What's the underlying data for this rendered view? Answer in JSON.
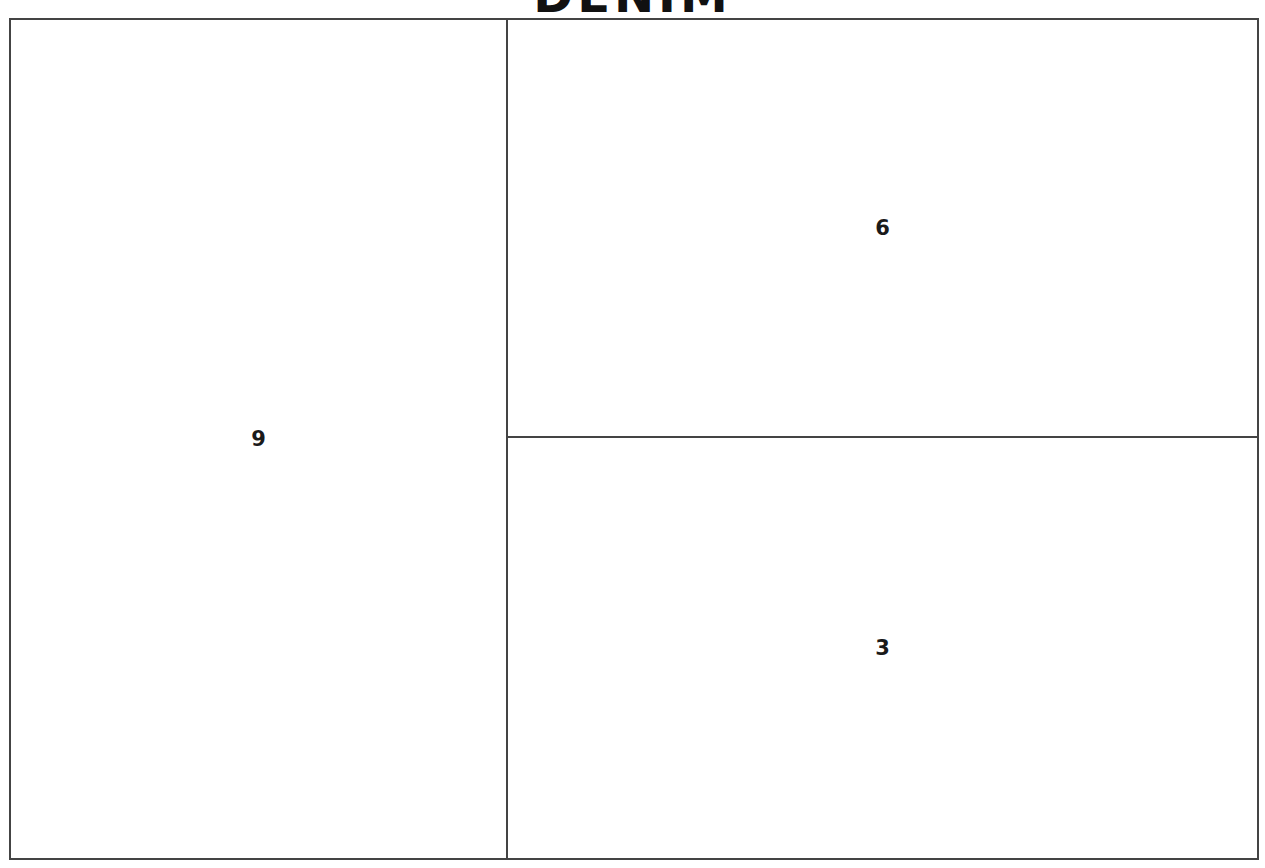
{
  "chart_data": {
    "type": "treemap",
    "title": "DENIM",
    "categories": [
      "A",
      "B",
      "C"
    ],
    "values": [
      9,
      6,
      3
    ],
    "labels": [
      "9",
      "6",
      "3"
    ],
    "layout": {
      "cells": [
        {
          "label": "9",
          "value": 9,
          "position": "left"
        },
        {
          "label": "6",
          "value": 6,
          "position": "top-right"
        },
        {
          "label": "3",
          "value": 3,
          "position": "bottom-right"
        }
      ]
    },
    "colors": {
      "fill": "#ffffff",
      "border": "#444444",
      "text": "#1a1a1a"
    }
  }
}
